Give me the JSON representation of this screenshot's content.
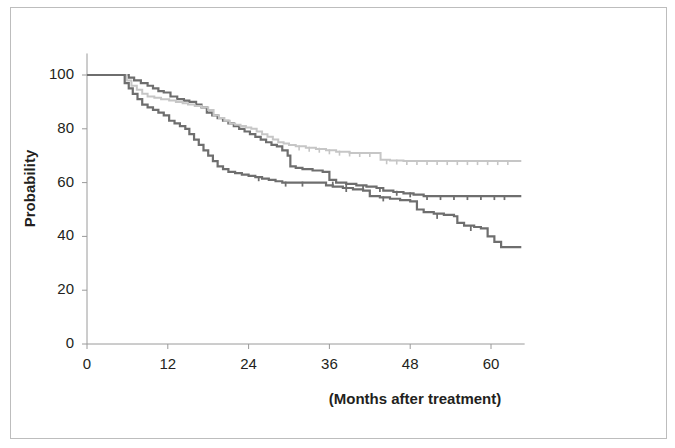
{
  "chart_data": {
    "type": "line",
    "title": "",
    "subtitle": "",
    "xlabel": "(Months after treatment)",
    "ylabel": "Probability",
    "xlim": [
      0,
      65
    ],
    "ylim": [
      0,
      108
    ],
    "xticks": [
      0,
      12,
      24,
      36,
      48,
      60
    ],
    "yticks": [
      0,
      20,
      40,
      60,
      80,
      100
    ],
    "xtick_labels": [
      "0",
      "12",
      "24",
      "36",
      "48",
      "60"
    ],
    "ytick_labels": [
      "0",
      "20",
      "40",
      "60",
      "80",
      "100"
    ],
    "grid": false,
    "legend": "none",
    "axis_color": "#9a9a9a",
    "series": [
      {
        "name": "curve-upper-dark",
        "color": "#6e6e6e",
        "line_width": 2.2,
        "final_value": 55,
        "points": [
          [
            0,
            100
          ],
          [
            5.5,
            100
          ],
          [
            6.2,
            99
          ],
          [
            7.0,
            98
          ],
          [
            8.0,
            97
          ],
          [
            9.0,
            96
          ],
          [
            9.8,
            95
          ],
          [
            10.6,
            94
          ],
          [
            11.4,
            93.5
          ],
          [
            12.4,
            92
          ],
          [
            13.4,
            91
          ],
          [
            14.4,
            90.5
          ],
          [
            15.2,
            90
          ],
          [
            16.2,
            89
          ],
          [
            17.0,
            88
          ],
          [
            17.8,
            86
          ],
          [
            18.6,
            85
          ],
          [
            19.4,
            84
          ],
          [
            20.2,
            83
          ],
          [
            21.0,
            82
          ],
          [
            21.8,
            81
          ],
          [
            22.6,
            80
          ],
          [
            23.4,
            79
          ],
          [
            24.2,
            78
          ],
          [
            25.0,
            77
          ],
          [
            25.8,
            76
          ],
          [
            26.6,
            75
          ],
          [
            27.4,
            74
          ],
          [
            28.2,
            73.5
          ],
          [
            29.0,
            72
          ],
          [
            29.8,
            70
          ],
          [
            30.2,
            66
          ],
          [
            31.0,
            65.5
          ],
          [
            32.0,
            65
          ],
          [
            33.5,
            64.5
          ],
          [
            35.0,
            64
          ],
          [
            36.0,
            61
          ],
          [
            37.0,
            60
          ],
          [
            38.5,
            59.5
          ],
          [
            40.0,
            59
          ],
          [
            41.5,
            58.5
          ],
          [
            43.0,
            58
          ],
          [
            44.0,
            57
          ],
          [
            45.5,
            56.5
          ],
          [
            47.0,
            56
          ],
          [
            48.5,
            55.5
          ],
          [
            50.0,
            55
          ],
          [
            52.0,
            55
          ],
          [
            55.0,
            55
          ],
          [
            58.0,
            55
          ],
          [
            61.0,
            55
          ],
          [
            64.5,
            55
          ]
        ],
        "censor_marks": [
          [
            36.5,
            60
          ],
          [
            38.5,
            59.5
          ],
          [
            41.0,
            58.7
          ],
          [
            43.5,
            58
          ],
          [
            46.0,
            56.6
          ],
          [
            48.0,
            56
          ],
          [
            50.5,
            55
          ],
          [
            52.5,
            55
          ],
          [
            54.5,
            55
          ],
          [
            56.5,
            55
          ],
          [
            58.5,
            55
          ],
          [
            60.5,
            55
          ],
          [
            62.0,
            55
          ]
        ]
      },
      {
        "name": "curve-middle-light",
        "color": "#c6c6c6",
        "line_width": 2.0,
        "final_value": 68,
        "points": [
          [
            0,
            100
          ],
          [
            5.2,
            100
          ],
          [
            5.9,
            98
          ],
          [
            6.6,
            96
          ],
          [
            7.4,
            94.5
          ],
          [
            8.2,
            93
          ],
          [
            9.0,
            92
          ],
          [
            10.0,
            91.5
          ],
          [
            11.0,
            91
          ],
          [
            12.2,
            90.5
          ],
          [
            13.2,
            90
          ],
          [
            14.2,
            89.5
          ],
          [
            15.0,
            89
          ],
          [
            16.0,
            88.5
          ],
          [
            17.0,
            88
          ],
          [
            18.0,
            87
          ],
          [
            18.8,
            85
          ],
          [
            19.6,
            84
          ],
          [
            20.4,
            83
          ],
          [
            21.2,
            82
          ],
          [
            22.0,
            81.5
          ],
          [
            22.8,
            81
          ],
          [
            23.6,
            80.5
          ],
          [
            24.4,
            80
          ],
          [
            25.2,
            79
          ],
          [
            26.0,
            78
          ],
          [
            26.8,
            77
          ],
          [
            27.6,
            76
          ],
          [
            28.4,
            75
          ],
          [
            29.2,
            74.5
          ],
          [
            30.0,
            74
          ],
          [
            31.0,
            73.5
          ],
          [
            32.5,
            73
          ],
          [
            34.0,
            72.5
          ],
          [
            35.5,
            72
          ],
          [
            37.0,
            71.5
          ],
          [
            39.0,
            71
          ],
          [
            41.0,
            71
          ],
          [
            43.0,
            71
          ],
          [
            43.6,
            68.5
          ],
          [
            45.0,
            68.2
          ],
          [
            47.0,
            68
          ],
          [
            50.0,
            68
          ],
          [
            54.0,
            68
          ],
          [
            58.0,
            68
          ],
          [
            62.0,
            68
          ],
          [
            64.5,
            68
          ]
        ],
        "censor_marks": [
          [
            31.5,
            73.4
          ],
          [
            33.0,
            73
          ],
          [
            34.5,
            72.6
          ],
          [
            36.0,
            72
          ],
          [
            37.5,
            71.5
          ],
          [
            39.0,
            71.2
          ],
          [
            40.5,
            71
          ],
          [
            42.0,
            71
          ],
          [
            44.5,
            68.3
          ],
          [
            46.0,
            68.2
          ],
          [
            47.5,
            68
          ],
          [
            49.0,
            68
          ],
          [
            50.5,
            68
          ],
          [
            52.0,
            68
          ],
          [
            53.5,
            68
          ],
          [
            55.0,
            68
          ],
          [
            56.5,
            68
          ],
          [
            58.0,
            68
          ],
          [
            59.5,
            68
          ],
          [
            61.0,
            68
          ],
          [
            62.5,
            68
          ]
        ]
      },
      {
        "name": "curve-lower-dark",
        "color": "#6e6e6e",
        "line_width": 2.2,
        "final_value": 36,
        "points": [
          [
            0,
            100
          ],
          [
            5.0,
            100
          ],
          [
            5.6,
            97
          ],
          [
            6.2,
            95
          ],
          [
            6.8,
            93
          ],
          [
            7.5,
            91
          ],
          [
            8.2,
            89
          ],
          [
            9.0,
            88
          ],
          [
            9.8,
            87
          ],
          [
            10.6,
            86
          ],
          [
            11.4,
            85
          ],
          [
            12.2,
            83
          ],
          [
            13.0,
            82
          ],
          [
            13.8,
            81
          ],
          [
            14.6,
            80
          ],
          [
            15.2,
            78
          ],
          [
            15.9,
            76
          ],
          [
            16.6,
            74
          ],
          [
            17.3,
            72
          ],
          [
            18.0,
            70
          ],
          [
            18.7,
            68
          ],
          [
            19.4,
            66
          ],
          [
            20.2,
            65
          ],
          [
            21.0,
            64
          ],
          [
            22.0,
            63.5
          ],
          [
            23.0,
            63
          ],
          [
            24.0,
            62.5
          ],
          [
            25.0,
            62
          ],
          [
            26.0,
            61.5
          ],
          [
            27.0,
            61
          ],
          [
            28.0,
            60.5
          ],
          [
            29.0,
            60
          ],
          [
            30.0,
            60
          ],
          [
            31.5,
            60
          ],
          [
            33.0,
            60
          ],
          [
            34.5,
            60
          ],
          [
            35.5,
            59
          ],
          [
            36.5,
            58.5
          ],
          [
            38.0,
            58
          ],
          [
            39.5,
            57.5
          ],
          [
            41.0,
            57
          ],
          [
            42.0,
            55
          ],
          [
            43.5,
            54.5
          ],
          [
            45.0,
            54
          ],
          [
            46.5,
            53.5
          ],
          [
            48.0,
            53
          ],
          [
            49.0,
            50
          ],
          [
            50.0,
            49
          ],
          [
            51.5,
            48.5
          ],
          [
            53.0,
            48
          ],
          [
            54.5,
            47.5
          ],
          [
            55.0,
            45
          ],
          [
            56.0,
            44
          ],
          [
            57.5,
            43.5
          ],
          [
            58.5,
            43
          ],
          [
            59.5,
            40
          ],
          [
            60.5,
            38
          ],
          [
            61.5,
            36
          ],
          [
            63.0,
            36
          ],
          [
            64.5,
            36
          ]
        ],
        "censor_marks": [
          [
            25.5,
            62
          ],
          [
            29.5,
            60
          ],
          [
            32.0,
            60
          ],
          [
            38.5,
            58
          ],
          [
            44.0,
            54.5
          ],
          [
            52.0,
            48
          ],
          [
            57.0,
            43.5
          ]
        ]
      }
    ]
  },
  "axes": {
    "y_title": "Probability",
    "x_title": "(Months after treatment)"
  }
}
